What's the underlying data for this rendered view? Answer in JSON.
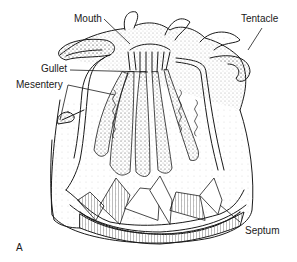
{
  "figure": {
    "panel": "A",
    "labels": {
      "mouth": "Mouth",
      "tentacle": "Tentacle",
      "gullet": "Gullet",
      "mesentery": "Mesentery",
      "septum": "Septum"
    },
    "colors": {
      "ink": "#1a1a1a",
      "background": "#ffffff"
    }
  }
}
